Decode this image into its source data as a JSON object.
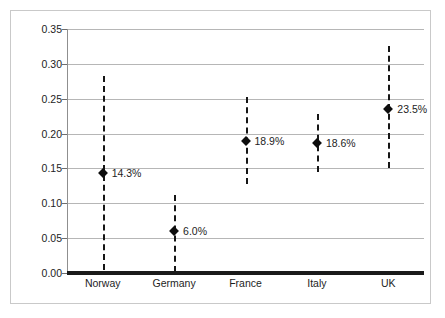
{
  "chart_data": {
    "type": "scatter",
    "title": "",
    "subtitle": "",
    "xlabel": "",
    "ylabel": "",
    "categories": [
      "Norway",
      "Germany",
      "France",
      "Italy",
      "UK"
    ],
    "values": [
      0.143,
      0.06,
      0.189,
      0.186,
      0.235
    ],
    "data_labels": [
      "14.3%",
      "6.0%",
      "18.9%",
      "18.6%",
      "23.5%"
    ],
    "error_low": [
      0.005,
      0.002,
      0.128,
      0.145,
      0.151
    ],
    "error_high": [
      0.283,
      0.112,
      0.253,
      0.228,
      0.326
    ],
    "ylim": [
      0.0,
      0.35
    ],
    "ytick_labels": [
      "0.00",
      "0.05",
      "0.10",
      "0.15",
      "0.20",
      "0.25",
      "0.30",
      "0.35"
    ],
    "ytick_values": [
      0.0,
      0.05,
      0.1,
      0.15,
      0.2,
      0.25,
      0.3,
      0.35
    ],
    "grid": true,
    "legend": "none",
    "series": [
      {
        "name": "point estimate with interval",
        "marker": "diamond",
        "marker_color": "#0d0d0d",
        "errorbar_style": "dashed",
        "errorbar_color": "#161616",
        "points": [
          {
            "category": "Norway",
            "value": 0.143,
            "label": "14.3%",
            "low": 0.005,
            "high": 0.283
          },
          {
            "category": "Germany",
            "value": 0.06,
            "label": "6.0%",
            "low": 0.002,
            "high": 0.112
          },
          {
            "category": "France",
            "value": 0.189,
            "label": "18.9%",
            "low": 0.128,
            "high": 0.253
          },
          {
            "category": "Italy",
            "value": 0.186,
            "label": "18.6%",
            "low": 0.145,
            "high": 0.228
          },
          {
            "category": "UK",
            "value": 0.235,
            "label": "23.5%",
            "low": 0.151,
            "high": 0.326
          }
        ]
      }
    ],
    "colors": {
      "background": "#ffffff",
      "gridline": "#b6b6b6",
      "axis": "#1a1a1a",
      "text": "#1d1d1d",
      "frame": "#c9c9c9"
    }
  }
}
